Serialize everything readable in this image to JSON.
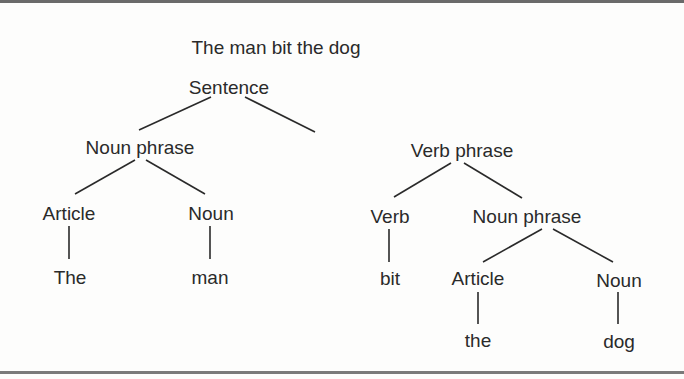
{
  "diagram": {
    "type": "syntax-tree",
    "title": "The man bit the dog",
    "nodes": {
      "sentence": "Sentence",
      "np_subject": "Noun phrase",
      "vp": "Verb phrase",
      "article_subject": "Article",
      "noun_subject": "Noun",
      "word_the_cap": "The",
      "word_man": "man",
      "verb": "Verb",
      "word_bit": "bit",
      "np_object": "Noun phrase",
      "article_object": "Article",
      "noun_object": "Noun",
      "word_the": "the",
      "word_dog": "dog"
    },
    "edges": [
      [
        "Sentence",
        "Noun phrase"
      ],
      [
        "Sentence",
        "Verb phrase"
      ],
      [
        "Noun phrase",
        "Article"
      ],
      [
        "Noun phrase",
        "Noun"
      ],
      [
        "Article",
        "The"
      ],
      [
        "Noun",
        "man"
      ],
      [
        "Verb phrase",
        "Verb"
      ],
      [
        "Verb phrase",
        "Noun phrase"
      ],
      [
        "Verb",
        "bit"
      ],
      [
        "Noun phrase",
        "Article"
      ],
      [
        "Noun phrase",
        "Noun"
      ],
      [
        "Article",
        "the"
      ],
      [
        "Noun",
        "dog"
      ]
    ],
    "colors": {
      "text": "#2a2a2a",
      "lines": "#2a2a2a",
      "background": "#fdfdfc",
      "rule": "#6a6a6a"
    }
  }
}
